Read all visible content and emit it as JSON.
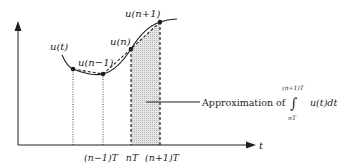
{
  "diagram": {
    "type": "numerical-integration-trapezoid",
    "axes": {
      "x_label": "t",
      "y_label": ""
    },
    "curve_label": "u(t)",
    "points": [
      {
        "label": "",
        "x": 73,
        "y": 69
      },
      {
        "label": "u(n−1)",
        "x": 103,
        "y": 74
      },
      {
        "label": "u(n)",
        "x": 131,
        "y": 49
      },
      {
        "label": "u(n+1)",
        "x": 160,
        "y": 22
      }
    ],
    "tick_labels": [
      {
        "text": "(n−1)T",
        "x": 101
      },
      {
        "text": "nT",
        "x": 132
      },
      {
        "text": "(n+1)T",
        "x": 161
      }
    ],
    "annotation": {
      "text": "Approximation of",
      "integral_upper": "(n+1)T",
      "integral_lower": "nT",
      "integral_sign": "∫",
      "integrand": "u(t)dt"
    },
    "colors": {
      "line": "#231f20",
      "shade": "#d9d9d9"
    }
  }
}
